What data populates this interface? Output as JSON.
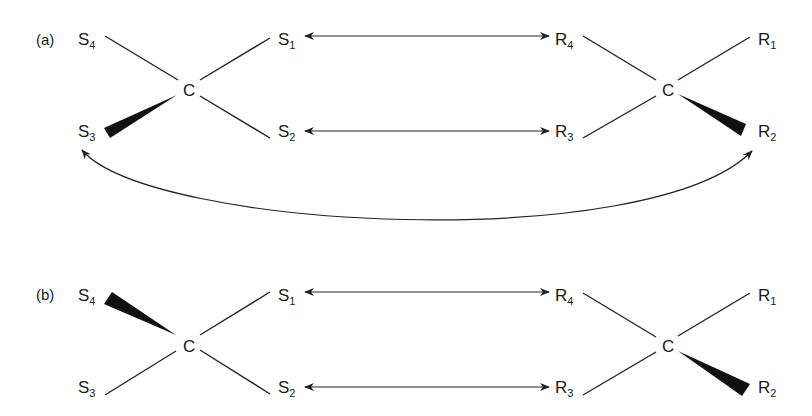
{
  "diagram": {
    "panels": [
      {
        "id": "a",
        "label": "(a)",
        "left_center": "C",
        "right_center": "C",
        "left_substituents": [
          {
            "pos": "top-left",
            "base": "S",
            "sub": "4",
            "bond": "plain"
          },
          {
            "pos": "top-right",
            "base": "S",
            "sub": "1",
            "bond": "plain"
          },
          {
            "pos": "bottom-left",
            "base": "S",
            "sub": "3",
            "bond": "wedge"
          },
          {
            "pos": "bottom-right",
            "base": "S",
            "sub": "2",
            "bond": "plain"
          }
        ],
        "right_substituents": [
          {
            "pos": "top-left",
            "base": "R",
            "sub": "4",
            "bond": "plain"
          },
          {
            "pos": "top-right",
            "base": "R",
            "sub": "1",
            "bond": "plain"
          },
          {
            "pos": "bottom-left",
            "base": "R",
            "sub": "3",
            "bond": "plain"
          },
          {
            "pos": "bottom-right",
            "base": "R",
            "sub": "2",
            "bond": "wedge"
          }
        ],
        "arrows": [
          {
            "from": "S1",
            "to": "R4",
            "type": "double-headed straight"
          },
          {
            "from": "S2",
            "to": "R3",
            "type": "double-headed straight"
          },
          {
            "from": "S3",
            "to": "R2",
            "type": "double-headed curved"
          }
        ]
      },
      {
        "id": "b",
        "label": "(b)",
        "left_center": "C",
        "right_center": "C",
        "left_substituents": [
          {
            "pos": "top-left",
            "base": "S",
            "sub": "4",
            "bond": "wedge"
          },
          {
            "pos": "top-right",
            "base": "S",
            "sub": "1",
            "bond": "plain"
          },
          {
            "pos": "bottom-left",
            "base": "S",
            "sub": "3",
            "bond": "plain"
          },
          {
            "pos": "bottom-right",
            "base": "S",
            "sub": "2",
            "bond": "plain"
          }
        ],
        "right_substituents": [
          {
            "pos": "top-left",
            "base": "R",
            "sub": "4",
            "bond": "plain"
          },
          {
            "pos": "top-right",
            "base": "R",
            "sub": "1",
            "bond": "plain"
          },
          {
            "pos": "bottom-left",
            "base": "R",
            "sub": "3",
            "bond": "plain"
          },
          {
            "pos": "bottom-right",
            "base": "R",
            "sub": "2",
            "bond": "wedge"
          }
        ],
        "arrows": [
          {
            "from": "S1",
            "to": "R4",
            "type": "double-headed straight"
          },
          {
            "from": "S2",
            "to": "R3",
            "type": "double-headed straight"
          }
        ]
      }
    ]
  }
}
